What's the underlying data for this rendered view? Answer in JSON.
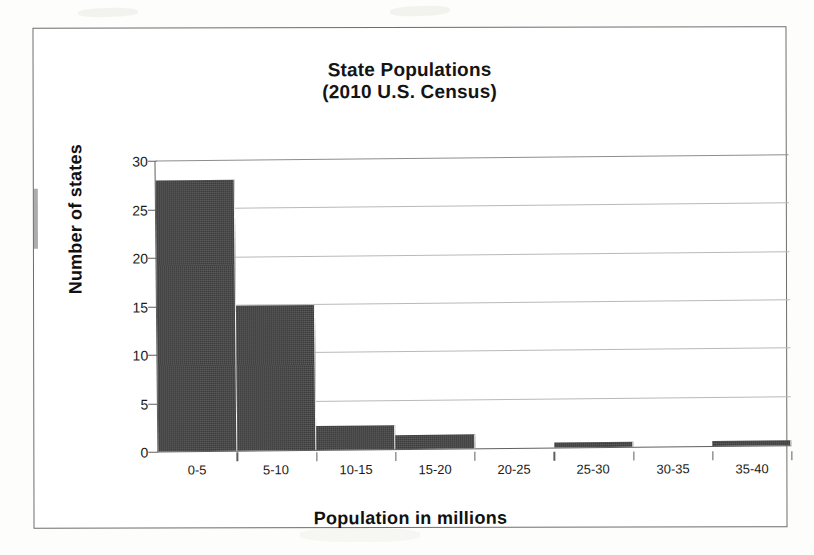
{
  "chart_data": {
    "type": "bar",
    "title": "State Populations",
    "subtitle": "(2010 U.S. Census)",
    "title_full": "State Populations (2010 U.S. Census)",
    "xlabel": "Population in millions",
    "ylabel": "Number of states",
    "categories": [
      "0-5",
      "5-10",
      "10-15",
      "15-20",
      "20-25",
      "25-30",
      "30-35",
      "35-40"
    ],
    "values": [
      28,
      15,
      2.5,
      1.5,
      0,
      0.5,
      0,
      0.5
    ],
    "ylim": [
      0,
      30
    ],
    "yticks": [
      0,
      5,
      10,
      15,
      20,
      25,
      30
    ],
    "ytick_labels": [
      "0",
      "5",
      "10",
      "15",
      "20",
      "25",
      "30"
    ],
    "grid": "horizontal",
    "legend": "none",
    "bar_color": "#3a3a3a",
    "gridline_color": "#b9b9b9",
    "axis_color": "#5f5f5f",
    "background_color": "#ffffff"
  }
}
